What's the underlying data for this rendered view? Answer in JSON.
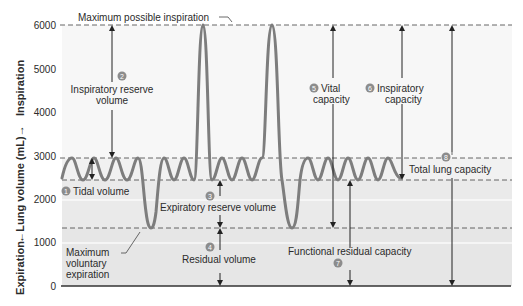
{
  "axis": {
    "ylabel_up": "Inspiration",
    "ylabel_mid": "←Lung volume (mL)→",
    "ylabel_down": "Expiration",
    "ticks": [
      "6000",
      "5000",
      "4000",
      "3000",
      "2000",
      "1000",
      "0"
    ]
  },
  "labels": {
    "max_insp": "Maximum possible inspiration",
    "irv_line1": "Inspiratory reserve",
    "irv_line2": "volume",
    "tidal": "Tidal volume",
    "erv": "Expiratory reserve volume",
    "rv": "Residual volume",
    "max_exp_1": "Maximum",
    "max_exp_2": "voluntary",
    "max_exp_3": "expiration",
    "vc_1": "Vital",
    "vc_2": "capacity",
    "ic_1": "Inspiratory",
    "ic_2": "capacity",
    "tlc": "Total lung capacity",
    "frc": "Functional residual capacity"
  },
  "badges": {
    "b1": "1",
    "b2": "2",
    "b3": "3",
    "b4": "4",
    "b5": "5",
    "b6": "6",
    "b7": "7",
    "b8": "8"
  },
  "colors": {
    "wave": "#7a7a7a",
    "badge": "#8c8c8c",
    "band_light": "#f5f5f5",
    "band_mid": "#ececec",
    "band_dark": "#e4e4e4",
    "text": "#2b2b2b"
  }
}
